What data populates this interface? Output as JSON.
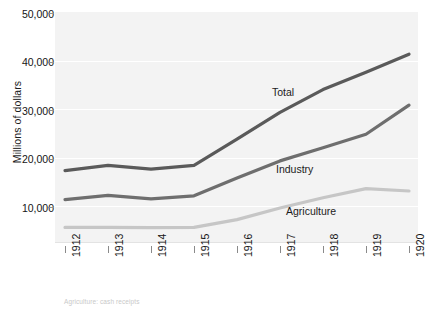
{
  "chart_data": {
    "type": "line",
    "title": "",
    "xlabel": "",
    "ylabel": "Millions of dollars",
    "categories": [
      "1912",
      "1913",
      "1914",
      "1915",
      "1916",
      "1917",
      "1918",
      "1919",
      "1920"
    ],
    "x": [
      1912,
      1913,
      1914,
      1915,
      1916,
      1917,
      1918,
      1919,
      1920
    ],
    "ylim": [
      0,
      50000
    ],
    "ytick_values": [
      10000,
      20000,
      30000,
      40000,
      50000
    ],
    "ytick_labels": [
      "10,000",
      "20,000",
      "30,000",
      "40,000",
      "50,000"
    ],
    "grid": true,
    "legend_position": "inline-labels",
    "series": [
      {
        "name": "Total",
        "color": "#5a5a5a",
        "values": [
          17500,
          18600,
          17800,
          18600,
          24000,
          29500,
          34200,
          37800,
          41500
        ]
      },
      {
        "name": "Industry",
        "color": "#6e6e6e",
        "values": [
          11500,
          12400,
          11700,
          12300,
          16000,
          19500,
          22200,
          25000,
          31000
        ]
      },
      {
        "name": "Agriculture",
        "color": "#c6c6c6",
        "values": [
          5800,
          5800,
          5750,
          5800,
          7400,
          9800,
          11900,
          13800,
          13300
        ]
      }
    ],
    "annotations": [
      {
        "text": "Total",
        "series": "Total"
      },
      {
        "text": "Industry",
        "series": "Industry"
      },
      {
        "text": "Agriculture",
        "series": "Agriculture"
      }
    ],
    "footnote": "Agriculture: cash receipts",
    "plot_background": "#f3f3f3",
    "gridline_color": "#ffffff"
  }
}
